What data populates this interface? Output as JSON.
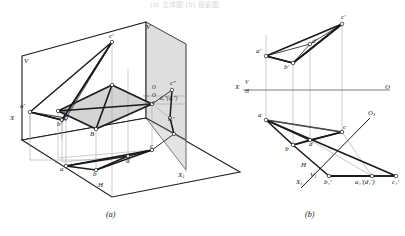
{
  "figure": {
    "top_partial_text": "(a) 立体图  (b) 投影图",
    "caption_a": "(a)",
    "caption_b": "(b)"
  },
  "pictorial": {
    "name": "three-dimensional pictorial of projection planes",
    "plane_labels": {
      "V": "V",
      "H": "H",
      "V1": "V",
      "X": "X",
      "X1": "X",
      "X1_sub": "1",
      "O": "O",
      "O1": "O"
    },
    "points": {
      "a_prime": "a'",
      "b_prime": "b'",
      "c_prime": "c'",
      "d_prime": "d'",
      "A": "A",
      "B": "B",
      "a": "a",
      "b": "b",
      "c": "c",
      "d": "d",
      "c_dprime": "c\"",
      "a1_dprime_pair": "a₁\"(d₁\")",
      "b1_dprime": "b₁\""
    }
  },
  "orthographic": {
    "name": "multiview orthographic projection with auxiliary view",
    "axis_left_label": "X",
    "axis_v_label": "V",
    "axis_h_label": "H",
    "axis_right_label": "O",
    "aux_axis": {
      "X1": "X",
      "X1_sub": "1",
      "V1": "V",
      "V1_sub": "1",
      "H": "H",
      "O1": "O",
      "O1_sub": "1"
    },
    "front_view_points": {
      "a_prime": "a'",
      "b_prime": "b'",
      "c_prime": "c'",
      "d_prime": "d'"
    },
    "top_view_points": {
      "a": "a",
      "b": "b",
      "c": "c",
      "d": "d"
    },
    "aux_view_points": {
      "b1_prime": "b₁'",
      "a1_d1_prime": "a₁'(d₁')",
      "c1_prime": "c₁'"
    }
  },
  "colors": {
    "line": "#1a1a1a",
    "thin_line": "#8a8a8a",
    "fill_face": "#d6d6d6",
    "plane_fill": "#ffffff",
    "marker_fill": "#ffffff"
  }
}
